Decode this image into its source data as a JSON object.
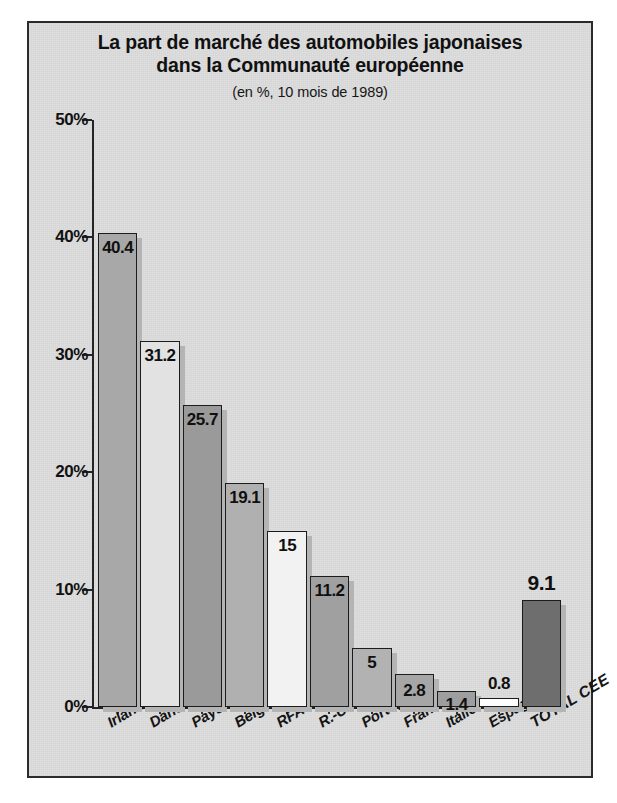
{
  "chart_data": {
    "type": "bar",
    "title": "La part de marché des automobiles japonaises dans la Communauté européenne",
    "title_line1": "La part de marché des automobiles japonaises",
    "title_line2": "dans la Communauté européenne",
    "subtitle": "(en %, 10 mois de 1989)",
    "xlabel": "",
    "ylabel": "",
    "ylim": [
      0,
      50
    ],
    "grid": false,
    "legend": "none",
    "ytick_labels": [
      "50%",
      "40%",
      "30%",
      "20%",
      "10%",
      "0%"
    ],
    "ytick_values": [
      50,
      40,
      30,
      20,
      10,
      0
    ],
    "categories": [
      "Irlande",
      "Danemark",
      "Pays-Bas",
      "Belg.-Lux.",
      "RFA",
      "R.-U.",
      "Portugal",
      "France",
      "Italie",
      "Espagne",
      "TOTAL CEE"
    ],
    "values": [
      40.4,
      31.2,
      25.7,
      19.1,
      15,
      11.2,
      5,
      2.8,
      1.4,
      0.8,
      9.1
    ],
    "value_labels": [
      "40.4",
      "31.2",
      "25.7",
      "19.1",
      "15",
      "11.2",
      "5",
      "2.8",
      "1.4",
      "0.8",
      "9.1"
    ],
    "bar_colors": [
      "#a8a8a8",
      "#e2e2e2",
      "#9a9a9a",
      "#b0b0b0",
      "#f2f2f2",
      "#a0a0a0",
      "#b2b2b2",
      "#a6a6a6",
      "#9e9e9e",
      "#fdfdfd",
      "#6e6e6e"
    ],
    "label_placement": [
      "inside",
      "inside",
      "inside",
      "inside",
      "inside",
      "inside",
      "inside",
      "inside",
      "inside",
      "above",
      "above"
    ],
    "highlight_index": 10,
    "plot_background": "#dedede",
    "axis_color": "#242424",
    "shadow_color": "#b4b4b4"
  }
}
